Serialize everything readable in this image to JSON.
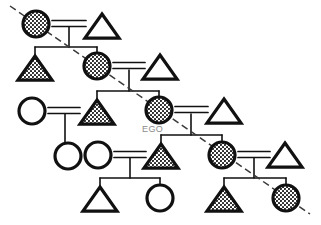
{
  "diagram": {
    "type": "kinship-chart",
    "background_color": "#ffffff",
    "line_color": "#111111",
    "fill_shaded_color": "#ffffff",
    "shaded_pattern": "dotted-hatch",
    "descent_line_style": "dashed",
    "descent_line_color": "#3a3a3a",
    "ego_label": "EGO",
    "ego_label_color": "#8a8a8a",
    "legend": {
      "circle": "female",
      "triangle": "male",
      "shaded": "lineage-member",
      "unshaded": "non-lineage-member",
      "double-bar": "marriage",
      "dashed-diagonal": "line-of-descent"
    },
    "symbols": [
      {
        "id": "g1-mother",
        "shape": "circle",
        "shaded": true,
        "cx": 36,
        "cy": 24,
        "r": 13,
        "generation": 1
      },
      {
        "id": "g1-father",
        "shape": "triangle",
        "shaded": false,
        "cx": 102,
        "cy": 26,
        "r": 14,
        "generation": 1
      },
      {
        "id": "g2-son",
        "shape": "triangle",
        "shaded": true,
        "cx": 35,
        "cy": 68,
        "r": 14,
        "generation": 2
      },
      {
        "id": "g2-daughter",
        "shape": "circle",
        "shaded": true,
        "cx": 97,
        "cy": 66,
        "r": 13,
        "generation": 2
      },
      {
        "id": "g2-husband",
        "shape": "triangle",
        "shaded": false,
        "cx": 160,
        "cy": 67,
        "r": 14,
        "generation": 2
      },
      {
        "id": "g3-wife",
        "shape": "circle",
        "shaded": false,
        "cx": 32,
        "cy": 111,
        "r": 13,
        "generation": 3
      },
      {
        "id": "g3-brother",
        "shape": "triangle",
        "shaded": true,
        "cx": 97,
        "cy": 112,
        "r": 14,
        "generation": 3
      },
      {
        "id": "g3-ego",
        "shape": "circle",
        "shaded": true,
        "cx": 159,
        "cy": 110,
        "r": 13,
        "generation": 3,
        "label": "EGO"
      },
      {
        "id": "g3-husband",
        "shape": "triangle",
        "shaded": false,
        "cx": 224,
        "cy": 111,
        "r": 14,
        "generation": 3
      },
      {
        "id": "g4-niece",
        "shape": "circle",
        "shaded": false,
        "cx": 68,
        "cy": 156,
        "r": 13,
        "generation": 4
      },
      {
        "id": "g4-wife",
        "shape": "circle",
        "shaded": false,
        "cx": 98,
        "cy": 155,
        "r": 13,
        "generation": 4
      },
      {
        "id": "g4-son",
        "shape": "triangle",
        "shaded": true,
        "cx": 161,
        "cy": 156,
        "r": 14,
        "generation": 4
      },
      {
        "id": "g4-daughter",
        "shape": "circle",
        "shaded": true,
        "cx": 222,
        "cy": 155,
        "r": 13,
        "generation": 4
      },
      {
        "id": "g4-husband",
        "shape": "triangle",
        "shaded": false,
        "cx": 285,
        "cy": 155,
        "r": 14,
        "generation": 4
      },
      {
        "id": "g5-grandson",
        "shape": "triangle",
        "shaded": false,
        "cx": 100,
        "cy": 199,
        "r": 14,
        "generation": 5
      },
      {
        "id": "g5-granddau",
        "shape": "circle",
        "shaded": false,
        "cx": 160,
        "cy": 198,
        "r": 13,
        "generation": 5
      },
      {
        "id": "g5-gson2",
        "shape": "triangle",
        "shaded": true,
        "cx": 224,
        "cy": 199,
        "r": 14,
        "generation": 5
      },
      {
        "id": "g5-gdau2",
        "shape": "circle",
        "shaded": true,
        "cx": 286,
        "cy": 198,
        "r": 13,
        "generation": 5
      }
    ],
    "marriages": [
      {
        "id": "m1",
        "left": "g1-mother",
        "right": "g1-father",
        "y": 24,
        "x1": 52,
        "x2": 86
      },
      {
        "id": "m2",
        "left": "g2-daughter",
        "right": "g2-husband",
        "y": 66,
        "x1": 113,
        "x2": 145
      },
      {
        "id": "m3",
        "left": "g3-wife",
        "right": "g3-brother",
        "y": 111,
        "x1": 48,
        "x2": 80
      },
      {
        "id": "m4",
        "left": "g3-ego",
        "right": "g3-husband",
        "y": 110,
        "x1": 175,
        "x2": 208
      },
      {
        "id": "m5",
        "left": "g4-wife",
        "right": "g4-son",
        "y": 155,
        "x1": 114,
        "x2": 146
      },
      {
        "id": "m6",
        "left": "g4-daughter",
        "right": "g4-husband",
        "y": 155,
        "x1": 238,
        "x2": 270
      }
    ],
    "descent_path": {
      "points": [
        [
          10,
          6
        ],
        [
          310,
          214
        ]
      ],
      "dash": "7,4"
    }
  }
}
